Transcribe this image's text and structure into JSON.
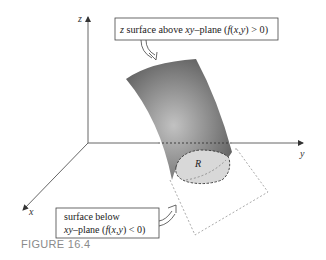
{
  "figure": {
    "caption": "FIGURE 16.4",
    "axes": {
      "z_label": "z",
      "y_label": "y",
      "x_label": "x"
    },
    "region_label": "R",
    "callouts": [
      {
        "id": "above",
        "text_parts": [
          "z",
          " surface above ",
          "xy",
          "–plane (",
          "f",
          "(",
          "x,y",
          ") > 0)"
        ]
      },
      {
        "id": "below",
        "line1": "surface below",
        "line2_parts": [
          "xy",
          "–plane (",
          "f",
          "(",
          "x,y",
          ") < 0)"
        ]
      }
    ],
    "colors": {
      "surface_dark": "#5a5a5a",
      "surface_light": "#b8b8b8",
      "region_fill": "#d6d6d6",
      "axis": "#555555",
      "dashed_outline": "#9a9a9a"
    }
  }
}
